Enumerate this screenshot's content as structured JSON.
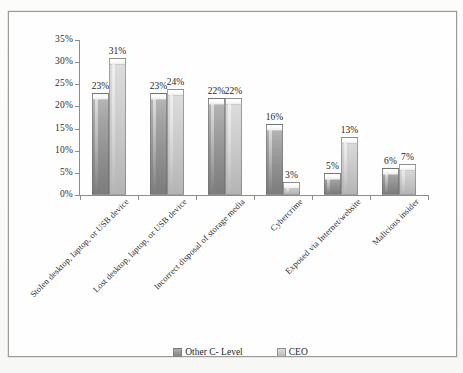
{
  "chart_data": {
    "type": "bar",
    "title": "",
    "xlabel": "",
    "ylabel": "",
    "ylim": [
      0,
      35
    ],
    "ytick_step": 5,
    "ytick_labels": [
      "0%",
      "5%",
      "10%",
      "15%",
      "20%",
      "25%",
      "30%",
      "35%"
    ],
    "grid": false,
    "legend_position": "bottom",
    "value_label_suffix": "%",
    "categories": [
      "Stolen desktop, laptop, or USB device",
      "Lost desktop, laptop, or USB device",
      "Incorrect disposal of storage media",
      "Cybercrime",
      "Exposed via Internet/website",
      "Malicious insider"
    ],
    "series": [
      {
        "name": "Other C- Level",
        "color": "#8f8f8f",
        "values": [
          23,
          23,
          22,
          16,
          5,
          6
        ],
        "value_labels": [
          "23%",
          "23%",
          "22%",
          "16%",
          "5%",
          "6%"
        ]
      },
      {
        "name": "CEO",
        "color": "#c6c6c6",
        "values": [
          31,
          24,
          22,
          3,
          13,
          7
        ],
        "value_labels": [
          "31%",
          "24%",
          "22%",
          "3%",
          "13%",
          "7%"
        ]
      }
    ]
  }
}
